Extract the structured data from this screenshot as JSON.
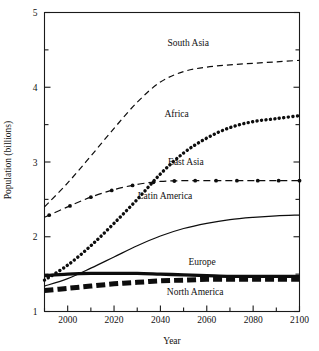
{
  "chart_data": {
    "type": "line",
    "title": "",
    "xlabel": "Year",
    "ylabel": "Population (billions)",
    "xlim": [
      1990,
      2100
    ],
    "ylim": [
      1,
      5
    ],
    "xticks": [
      2000,
      2020,
      2040,
      2060,
      2080,
      2100
    ],
    "xtick_labels": [
      "2000",
      "2020",
      "2040",
      "2060",
      "2080",
      "2100"
    ],
    "xminor_step": 10,
    "yticks": [
      1,
      2,
      3,
      4,
      5
    ],
    "ytick_labels": [
      "1",
      "2",
      "3",
      "4",
      "5"
    ],
    "yminor_step": 0.5,
    "grid": false,
    "legend": "inline-labels",
    "x": [
      1990,
      2000,
      2010,
      2020,
      2030,
      2040,
      2050,
      2060,
      2070,
      2080,
      2090,
      2100
    ],
    "series": [
      {
        "name": "South Asia",
        "style": "dashed",
        "label_x": 2052,
        "label_y": 4.55,
        "values": [
          2.4,
          2.72,
          3.08,
          3.45,
          3.8,
          4.07,
          4.21,
          4.27,
          4.3,
          4.32,
          4.34,
          4.36
        ]
      },
      {
        "name": "Africa",
        "style": "dotted-thick",
        "label_x": 2047,
        "label_y": 3.6,
        "values": [
          1.42,
          1.62,
          1.88,
          2.18,
          2.5,
          2.84,
          3.12,
          3.32,
          3.46,
          3.54,
          3.58,
          3.62
        ]
      },
      {
        "name": "East Asia",
        "style": "dash-dot-marker",
        "label_x": 2051,
        "label_y": 2.96,
        "values": [
          2.26,
          2.4,
          2.53,
          2.63,
          2.7,
          2.74,
          2.75,
          2.75,
          2.75,
          2.75,
          2.75,
          2.75
        ]
      },
      {
        "name": "Latin America",
        "style": "solid-thin",
        "label_x": 2042,
        "label_y": 2.5,
        "values": [
          1.34,
          1.44,
          1.58,
          1.73,
          1.88,
          2.01,
          2.11,
          2.18,
          2.23,
          2.26,
          2.28,
          2.29
        ]
      },
      {
        "name": "Europe",
        "style": "solid-thick",
        "label_x": 2058,
        "label_y": 1.62,
        "values": [
          1.48,
          1.5,
          1.51,
          1.51,
          1.51,
          1.5,
          1.49,
          1.48,
          1.47,
          1.47,
          1.47,
          1.47
        ]
      },
      {
        "name": "North America",
        "style": "dashed-thick",
        "label_x": 2055,
        "label_y": 1.22,
        "values": [
          1.28,
          1.31,
          1.34,
          1.37,
          1.39,
          1.41,
          1.42,
          1.43,
          1.43,
          1.43,
          1.43,
          1.43
        ]
      }
    ]
  }
}
